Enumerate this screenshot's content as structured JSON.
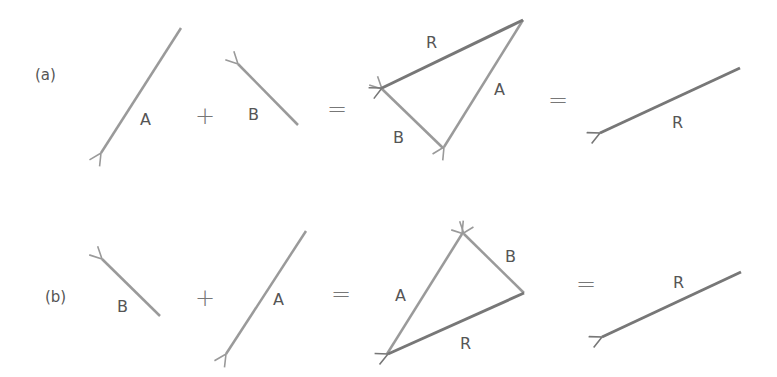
{
  "diagram": {
    "colors": {
      "vector_A": "#9a9a9a",
      "vector_B": "#9a9a9a",
      "vector_R": "#777777",
      "text": "#555555"
    },
    "rows": [
      {
        "part_label": "(a)",
        "terms": [
          {
            "label": "A"
          },
          {
            "operator": "+"
          },
          {
            "label": "B"
          },
          {
            "operator": "="
          },
          {
            "triangle_labels": [
              "R",
              "A",
              "B"
            ]
          },
          {
            "operator": "="
          },
          {
            "label": "R"
          }
        ]
      },
      {
        "part_label": "(b)",
        "terms": [
          {
            "label": "B"
          },
          {
            "operator": "+"
          },
          {
            "label": "A"
          },
          {
            "operator": "="
          },
          {
            "triangle_labels": [
              "B",
              "A",
              "R"
            ]
          },
          {
            "operator": "="
          },
          {
            "label": "R"
          }
        ]
      }
    ],
    "text": {
      "a_part": "(a)",
      "b_part": "(b)",
      "plus": "+",
      "equals": "=",
      "A": "A",
      "B": "B",
      "R": "R"
    }
  }
}
